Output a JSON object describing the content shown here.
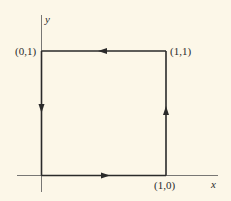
{
  "diagram": {
    "type": "closed path around unit square (counterclockwise)",
    "axes": {
      "x_label": "x",
      "y_label": "y"
    },
    "vertices": [
      {
        "label": "(0,1)"
      },
      {
        "label": "(1,1)"
      },
      {
        "label": "(1,0)"
      }
    ],
    "edges": [
      {
        "from": "(0,0)",
        "to": "(1,0)",
        "direction": "right"
      },
      {
        "from": "(1,0)",
        "to": "(1,1)",
        "direction": "up"
      },
      {
        "from": "(1,1)",
        "to": "(0,1)",
        "direction": "left"
      },
      {
        "from": "(0,1)",
        "to": "(0,0)",
        "direction": "down"
      }
    ],
    "colors": {
      "background": "#fcf7e8",
      "stroke": "#2a2a2a"
    }
  }
}
